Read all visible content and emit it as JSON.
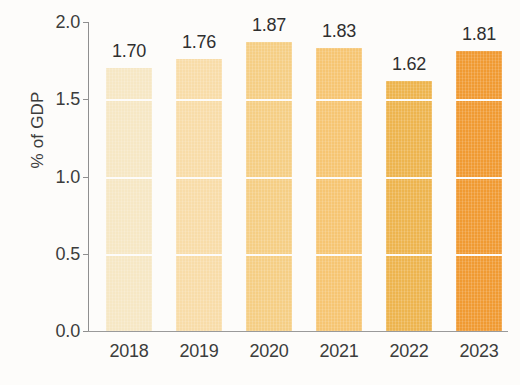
{
  "chart_data": {
    "type": "bar",
    "title": "",
    "xlabel": "",
    "ylabel": "% of GDP",
    "categories": [
      "2018",
      "2019",
      "2020",
      "2021",
      "2022",
      "2023"
    ],
    "values": [
      1.7,
      1.76,
      1.87,
      1.83,
      1.62,
      1.81
    ],
    "data_labels": [
      "1.70",
      "1.76",
      "1.87",
      "1.83",
      "1.62",
      "1.81"
    ],
    "bar_colors": [
      "#F6E7C4",
      "#F8DCA8",
      "#F5CE84",
      "#F6C572",
      "#EDB44E",
      "#F09A32"
    ],
    "ylim": [
      0.0,
      2.0
    ],
    "ytick_labels": [
      "0.0",
      "0.5",
      "1.0",
      "1.5",
      "2.0"
    ],
    "ytick_values": [
      0.0,
      0.5,
      1.0,
      1.5,
      2.0
    ],
    "grid": true,
    "gridline_color": "#FDFCFA",
    "legend": "none",
    "axis_color": "#8F8F8F",
    "text_color": "#3C3C3C",
    "background": "#FDFCFA"
  }
}
